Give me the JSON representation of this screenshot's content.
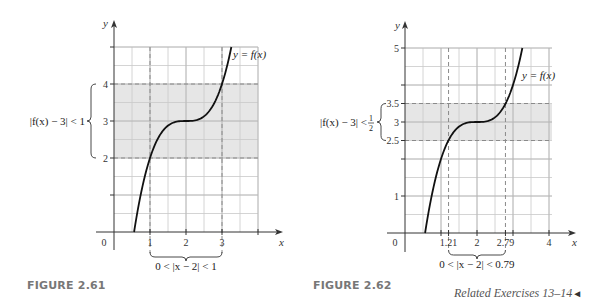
{
  "chart_data": [
    {
      "type": "line",
      "figure_label": "FIGURE 2.61",
      "function": "y = 3 + (x - 2)^3",
      "curve_label": "y = f(x)",
      "xlabel": "x",
      "ylabel": "y",
      "x_ticks": [
        {
          "value": 0,
          "label": "0"
        },
        {
          "value": 1,
          "label": "1"
        },
        {
          "value": 2,
          "label": "2"
        },
        {
          "value": 3,
          "label": "3"
        },
        {
          "value": 4,
          "label": ""
        }
      ],
      "y_ticks": [
        {
          "value": 1,
          "label": ""
        },
        {
          "value": 2,
          "label": "2"
        },
        {
          "value": 3,
          "label": "3"
        },
        {
          "value": 4,
          "label": "4"
        },
        {
          "value": 5,
          "label": ""
        }
      ],
      "xlim": [
        0,
        4
      ],
      "ylim": [
        0,
        5
      ],
      "grid": true,
      "grid_step": 0.5,
      "shaded_band_y": [
        2,
        4
      ],
      "dashed_x": [
        1,
        3
      ],
      "dashed_y": [
        2,
        4
      ],
      "y_annotation": "|f(x) − 3| < 1",
      "x_annotation": "0 < |x − 2| < 1",
      "x_brace": [
        1,
        3
      ],
      "y_brace": [
        2,
        4
      ]
    },
    {
      "type": "line",
      "figure_label": "FIGURE 2.62",
      "function": "y = 3 + (x - 2)^3",
      "curve_label": "y = f(x)",
      "xlabel": "x",
      "ylabel": "y",
      "x_ticks": [
        {
          "value": 0,
          "label": "0"
        },
        {
          "value": 1,
          "label": ""
        },
        {
          "value": 1.21,
          "label": "1.21"
        },
        {
          "value": 2,
          "label": "2"
        },
        {
          "value": 2.79,
          "label": "2.79"
        },
        {
          "value": 3,
          "label": ""
        },
        {
          "value": 4,
          "label": "4"
        }
      ],
      "y_ticks": [
        {
          "value": 1,
          "label": "1"
        },
        {
          "value": 2,
          "label": ""
        },
        {
          "value": 2.5,
          "label": "2.5"
        },
        {
          "value": 3,
          "label": "3"
        },
        {
          "value": 3.5,
          "label": "3.5"
        },
        {
          "value": 4,
          "label": ""
        },
        {
          "value": 5,
          "label": "5"
        }
      ],
      "xlim": [
        0,
        4
      ],
      "ylim": [
        0,
        5
      ],
      "grid": true,
      "grid_step": 0.5,
      "shaded_band_y": [
        2.5,
        3.5
      ],
      "dashed_x": [
        1.21,
        2.79
      ],
      "dashed_y": [
        2.5,
        3.5
      ],
      "y_annotation_main": "|f(x) − 3| < ",
      "y_annotation_frac_num": "1",
      "y_annotation_frac_den": "2",
      "x_annotation": "0 < |x − 2| < 0.79",
      "x_brace": [
        1.21,
        2.79
      ],
      "y_brace": [
        2.5,
        3.5
      ]
    }
  ],
  "captions": {
    "fig1": "FIGURE 2.61",
    "fig2": "FIGURE 2.62",
    "related": "Related Exercises 13–14",
    "related_arrow": "◄"
  },
  "colors": {
    "grid": "#c9c9c9",
    "shade": "#e6e6e6",
    "dashed": "#8a8a8a",
    "axis": "#333333",
    "curve": "#111111",
    "caption": "#777777"
  }
}
